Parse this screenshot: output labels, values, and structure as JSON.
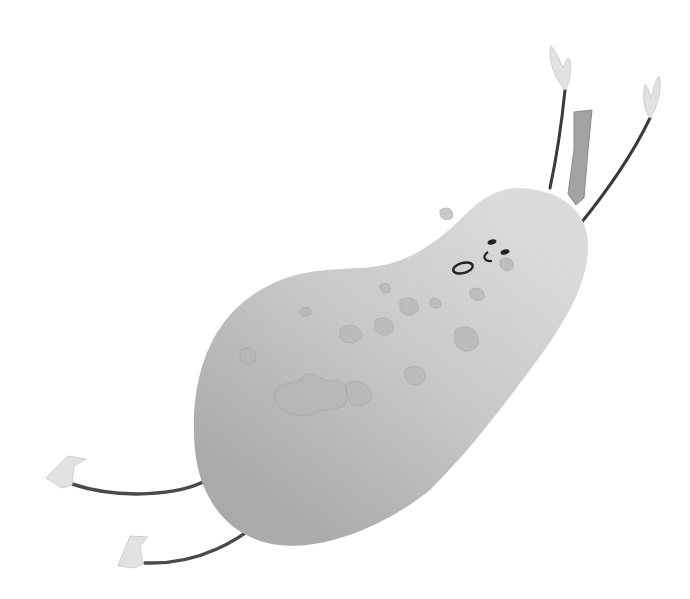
{
  "image": {
    "subject": "Watercolor pear character with face, stem, arms and legs",
    "style": "grayscale watercolor illustration",
    "background_color": "#ffffff",
    "colors": {
      "body_light": "#d8d8d8",
      "body_mid": "#bdbdbd",
      "body_dark": "#a9a9a9",
      "spots": "#b3b3b3",
      "outline": "#3a3a3a",
      "stem": "#9a9a9a",
      "hands_feet": "#e2e2e2",
      "face": "#222222"
    }
  },
  "elements": {
    "pear_body": "pear-body",
    "stem": "stem",
    "face": "face",
    "left_arm": "arm raised with mitten hand",
    "right_arm": "arm raised with mitten hand",
    "upper_leg": "leg with boot foot",
    "lower_leg": "leg with boot foot"
  }
}
